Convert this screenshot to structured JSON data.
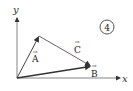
{
  "diagram": {
    "type": "vector-diagram",
    "badge_number": "4",
    "axes": {
      "x_label": "x",
      "y_label": "y"
    },
    "vectors": [
      {
        "name": "A",
        "label": "A",
        "from": "origin",
        "to": "tip-of-A"
      },
      {
        "name": "B",
        "label": "B",
        "from": "origin",
        "to": "tip-of-B"
      },
      {
        "name": "C",
        "label": "C",
        "from": "tip-of-A",
        "to": "tip-of-B"
      }
    ],
    "arrow_symbol": "→",
    "colors": {
      "line": "#555555",
      "vector_b": "#333333",
      "background": "#ffffff"
    }
  }
}
